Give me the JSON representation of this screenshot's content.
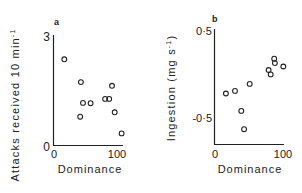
{
  "chart_data": [
    {
      "type": "scatter",
      "panel": "a",
      "title": "",
      "xlabel": "Dominance",
      "ylabel": "Attacks received 10 min",
      "ylabel_sup": "-1",
      "xlim": [
        0,
        100
      ],
      "ylim": [
        0,
        3
      ],
      "x_ticks": [
        "0",
        "100"
      ],
      "y_ticks": [
        "0",
        "3"
      ],
      "grid": false,
      "points": [
        {
          "x": 15,
          "y": 2.36
        },
        {
          "x": 39,
          "y": 1.73
        },
        {
          "x": 42,
          "y": 1.16
        },
        {
          "x": 53,
          "y": 1.15
        },
        {
          "x": 38,
          "y": 0.78
        },
        {
          "x": 74,
          "y": 1.27
        },
        {
          "x": 80,
          "y": 1.27
        },
        {
          "x": 84,
          "y": 1.63
        },
        {
          "x": 88,
          "y": 0.9
        },
        {
          "x": 98,
          "y": 0.32
        }
      ]
    },
    {
      "type": "scatter",
      "panel": "b",
      "title": "",
      "xlabel": "Dominance",
      "ylabel": "Ingestion (mg s",
      "ylabel_sup": "-1",
      "ylabel_end": ")",
      "xlim": [
        0,
        100
      ],
      "ylim": [
        -0.8,
        0.5
      ],
      "x_ticks": [
        "0",
        "100"
      ],
      "y_ticks": [
        "0·5",
        "-0·5"
      ],
      "grid": false,
      "points": [
        {
          "x": 17,
          "y": -0.23
        },
        {
          "x": 30,
          "y": -0.2
        },
        {
          "x": 51,
          "y": -0.12
        },
        {
          "x": 39,
          "y": -0.43
        },
        {
          "x": 43,
          "y": -0.64
        },
        {
          "x": 78,
          "y": 0.04
        },
        {
          "x": 81,
          "y": -0.01
        },
        {
          "x": 86,
          "y": 0.17
        },
        {
          "x": 87,
          "y": 0.12
        },
        {
          "x": 99,
          "y": 0.08
        }
      ]
    }
  ],
  "panels": {
    "a": {
      "label": "a",
      "ytick_top": "3",
      "ytick_bottom": "0",
      "xtick_left": "0",
      "xtick_right": "100",
      "xlabel": "Dominance",
      "ylabel": "Attacks received 10 min",
      "ylabel_sup": "-1"
    },
    "b": {
      "label": "b",
      "ytick_top": "0·5",
      "ytick_mid": "-0·5",
      "xtick_left": "0",
      "xtick_right": "100",
      "xlabel": "Dominance",
      "ylabel": "Ingestion (mg s",
      "ylabel_sup": "-1",
      "ylabel_end": ")"
    }
  }
}
